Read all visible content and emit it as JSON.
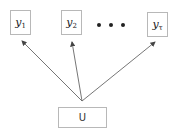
{
  "diagram": {
    "outputs": [
      {
        "base": "y",
        "sub": "1"
      },
      {
        "base": "y",
        "sub": "2"
      },
      {
        "base": "y",
        "sub": "τ"
      }
    ],
    "ellipsis": "• • •",
    "input": {
      "label": "U"
    },
    "colors": {
      "border": "#b8b8b8",
      "arrow": "#555555",
      "text": "#222222"
    }
  }
}
